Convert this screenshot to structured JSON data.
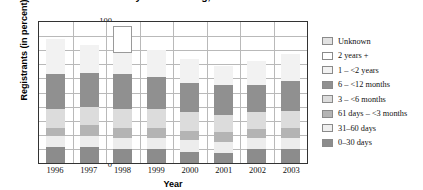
{
  "chart_data": {
    "type": "bar",
    "stacked": true,
    "title": "of Calendar Year by Time Waiting, 1996–2003",
    "xlabel": "Year",
    "ylabel": "Registrants (in percent)",
    "categories": [
      "1996",
      "1997",
      "1998",
      "1999",
      "2000",
      "2001",
      "2002",
      "2003"
    ],
    "ylim": [
      0,
      100
    ],
    "yticks": [
      "0",
      "10",
      "20",
      "30",
      "40",
      "50",
      "60",
      "70",
      "80",
      "90",
      "100"
    ],
    "grid": true,
    "legend_position": "right",
    "series": [
      {
        "name": "0–30 days",
        "color": "#8c8c8c",
        "values": [
          11,
          11,
          10,
          10,
          8,
          7,
          10,
          10
        ]
      },
      {
        "name": "31–60 days",
        "color": "#ededed",
        "values": [
          8,
          8,
          8,
          8,
          8,
          8,
          8,
          8
        ]
      },
      {
        "name": "61 days – <3 months",
        "color": "#b4b4b4",
        "values": [
          6,
          8,
          7,
          7,
          7,
          7,
          6,
          7
        ]
      },
      {
        "name": "3 – <6 months",
        "color": "#dcdcdc",
        "values": [
          13,
          13,
          13,
          13,
          13,
          12,
          12,
          12
        ]
      },
      {
        "name": "6 – <12 months",
        "color": "#909090",
        "values": [
          25,
          24,
          25,
          23,
          21,
          21,
          19,
          21
        ]
      },
      {
        "name": "1 – <2 years",
        "color": "#f2f2f2",
        "values": [
          25,
          20,
          15,
          19,
          17,
          14,
          17,
          19
        ]
      },
      {
        "name": "2 years +",
        "color": "#ffffff",
        "values": [
          0,
          0,
          19,
          0,
          0,
          0,
          0,
          0
        ]
      },
      {
        "name": "Unknown",
        "color": "#e2e2e2",
        "values": [
          0,
          0,
          0,
          0,
          0,
          0,
          0,
          0
        ]
      }
    ],
    "legend_order": [
      "Unknown",
      "2 years +",
      "1 – <2 years",
      "6 – <12 months",
      "3 – <6 months",
      "61 days – <3 months",
      "31–60 days",
      "0–30 days"
    ],
    "legend_colors": [
      "#e2e2e2",
      "#ffffff",
      "#f2f2f2",
      "#909090",
      "#dcdcdc",
      "#b4b4b4",
      "#efefef",
      "#8c8c8c"
    ]
  }
}
